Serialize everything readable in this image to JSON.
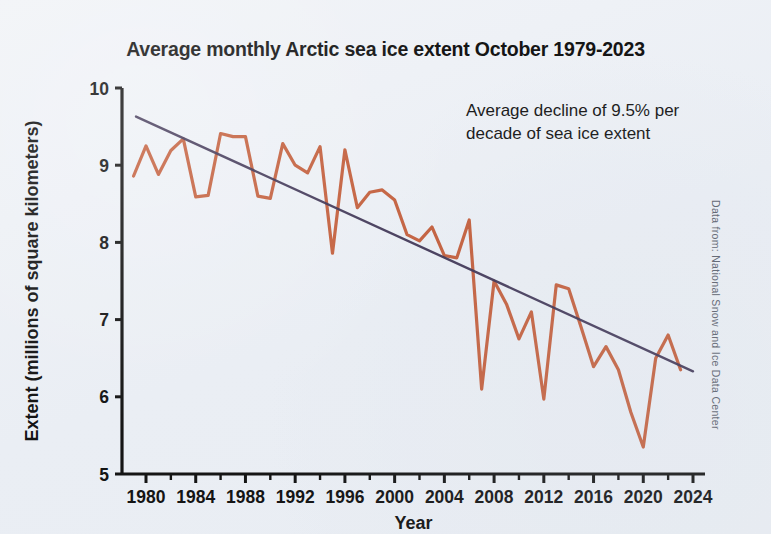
{
  "figure": {
    "background_color": "#eef1f6",
    "title": "Average monthly Arctic sea ice extent October 1979-2023",
    "annotation": "Average decline of 9.5% per decade of sea ice extent",
    "source_note": "Data from: National Snow and Ice Data Center"
  },
  "chart_data": {
    "type": "line",
    "title": "Average monthly Arctic sea ice extent October 1979-2023",
    "xlabel": "Year",
    "ylabel": "Extent (millions of square kilometers)",
    "xlim": [
      1979,
      2024
    ],
    "ylim": [
      5,
      10
    ],
    "xticks": [
      1980,
      1984,
      1988,
      1992,
      1996,
      2000,
      2004,
      2008,
      2012,
      2016,
      2020,
      2024
    ],
    "xtick_labels": [
      "1980",
      "1984",
      "1988",
      "1992",
      "1996",
      "2000",
      "2004",
      "2008",
      "2012",
      "2016",
      "2020",
      "2024"
    ],
    "minor_xticks": [
      1982,
      1986,
      1990,
      1994,
      1998,
      2002,
      2006,
      2010,
      2014,
      2018,
      2022
    ],
    "yticks": [
      5,
      6,
      7,
      8,
      9,
      10
    ],
    "ytick_labels": [
      "5",
      "6",
      "7",
      "8",
      "9",
      "10"
    ],
    "grid": false,
    "legend": null,
    "annotations": [
      {
        "text": "Average decline of 9.5% per decade of sea ice extent",
        "x": 1998,
        "y": 9.55
      }
    ],
    "series": [
      {
        "name": "October Arctic sea ice extent",
        "color": "#c0552f",
        "linewidth": 3.2,
        "x": [
          1979,
          1980,
          1981,
          1982,
          1983,
          1984,
          1985,
          1986,
          1987,
          1988,
          1989,
          1990,
          1991,
          1992,
          1993,
          1994,
          1995,
          1996,
          1997,
          1998,
          1999,
          2000,
          2001,
          2002,
          2003,
          2004,
          2005,
          2006,
          2007,
          2008,
          2009,
          2010,
          2011,
          2012,
          2013,
          2014,
          2015,
          2016,
          2017,
          2018,
          2019,
          2020,
          2021,
          2022,
          2023
        ],
        "values": [
          8.86,
          9.25,
          8.88,
          9.19,
          9.34,
          8.59,
          8.61,
          9.41,
          9.37,
          9.37,
          8.6,
          8.57,
          9.28,
          9.0,
          8.9,
          9.24,
          7.86,
          9.2,
          8.45,
          8.65,
          8.68,
          8.55,
          8.1,
          8.02,
          8.2,
          7.83,
          7.8,
          8.29,
          6.1,
          7.5,
          7.2,
          6.75,
          7.1,
          5.97,
          7.45,
          7.4,
          6.9,
          6.39,
          6.65,
          6.35,
          5.8,
          5.35,
          6.5,
          6.8,
          6.35
        ]
      },
      {
        "name": "Linear trend",
        "color": "#3d3353",
        "linewidth": 2.4,
        "x": [
          1979.2,
          2024
        ],
        "values": [
          9.63,
          6.33
        ]
      }
    ]
  }
}
